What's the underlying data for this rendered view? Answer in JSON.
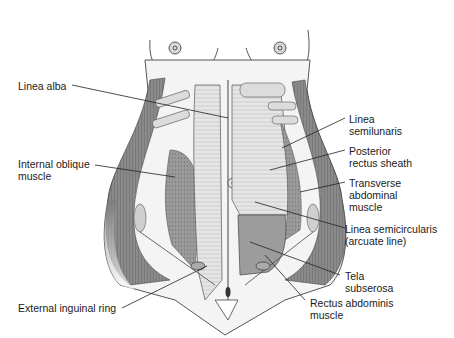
{
  "figure": {
    "labels": {
      "linea_alba": {
        "lines": [
          "Linea alba"
        ]
      },
      "internal_oblique": {
        "lines": [
          "Internal oblique",
          "muscle"
        ]
      },
      "external_inguinal_ring": {
        "lines": [
          "External inguinal ring"
        ]
      },
      "linea_semilunaris": {
        "lines": [
          "Linea",
          "semilunaris"
        ]
      },
      "posterior_rectus_sheath": {
        "lines": [
          "Posterior",
          "rectus sheath"
        ]
      },
      "transverse_abdominal": {
        "lines": [
          "Transverse",
          "abdominal",
          "muscle"
        ]
      },
      "linea_semicircularis": {
        "lines": [
          "Linea semicircularis",
          "(arcuate line)"
        ]
      },
      "tela_subserosa": {
        "lines": [
          "Tela",
          "subserosa"
        ]
      },
      "rectus_abdominis": {
        "lines": [
          "Rectus abdominis",
          "muscle"
        ]
      }
    },
    "colors": {
      "outline": "#3a3a3a",
      "muscle_dark": "#7d7d7d",
      "muscle_mid": "#a8a8a8",
      "fascia_light": "#e2e2e2",
      "skin": "#f6f6f6",
      "leader": "#222222"
    }
  }
}
